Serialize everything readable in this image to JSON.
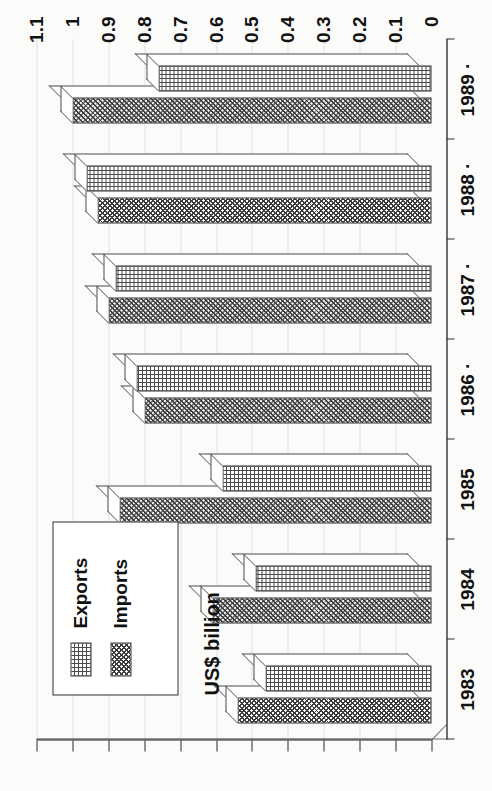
{
  "chart_data": {
    "type": "bar",
    "orientation": "horizontal",
    "title": "",
    "xlabel": "",
    "ylabel": "US$ billion",
    "categories": [
      "1983",
      "1984",
      "1985",
      "1986",
      "1987",
      "1988",
      "1989 ·"
    ],
    "category_labels_display": [
      "1983",
      "1984",
      "1985",
      "1986 ·",
      "1987 ·",
      "1988 ·",
      "1989 ·"
    ],
    "value_axis_ticks": [
      "1.1",
      "1",
      "0.9",
      "0.8",
      "0.7",
      "0.6",
      "0.5",
      "0.4",
      "0.3",
      "0.2",
      "0.1",
      "0"
    ],
    "value_axis_tick_values": [
      1.1,
      1.0,
      0.9,
      0.8,
      0.7,
      0.6,
      0.5,
      0.4,
      0.3,
      0.2,
      0.1,
      0
    ],
    "ylim": [
      0,
      1.1
    ],
    "grid": true,
    "grid_axis": "value",
    "legend_position": "inside-lower-left",
    "series": [
      {
        "name": "Exports",
        "pattern": "cross-hatch-grid",
        "values": [
          0.5,
          0.53,
          0.62,
          0.86,
          0.92,
          1.0,
          0.8
        ]
      },
      {
        "name": "Imports",
        "pattern": "diagonal-cross-hatch",
        "values": [
          0.54,
          0.61,
          0.87,
          0.8,
          0.9,
          0.93,
          1.0
        ]
      }
    ]
  },
  "legend": {
    "items": [
      {
        "label": "Exports",
        "swatch": "cross-hatch-grid-swatch"
      },
      {
        "label": "Imports",
        "swatch": "diagonal-hatch-swatch"
      }
    ]
  },
  "axis": {
    "value_title": "US$ billion"
  }
}
